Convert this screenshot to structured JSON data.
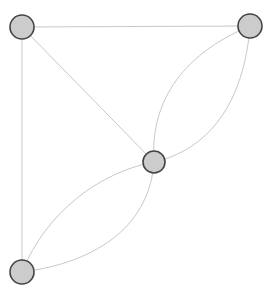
{
  "diagram": {
    "type": "graph",
    "width": 274,
    "height": 295,
    "background_color": "#ffffff"
  },
  "style": {
    "node_fill": "#cccccc",
    "node_stroke": "#444444",
    "node_stroke_width": 1.6,
    "node_radius": 12,
    "edge_color": "#c8c8c8",
    "edge_width": 1
  },
  "chart_data": {
    "type": "diagram",
    "nodes": [
      {
        "id": "top-left",
        "label": "1",
        "x": 22,
        "y": 27,
        "r": 12
      },
      {
        "id": "top-right",
        "label": "2",
        "x": 250,
        "y": 26,
        "r": 12
      },
      {
        "id": "center",
        "label": "3",
        "x": 154,
        "y": 162,
        "r": 11
      },
      {
        "id": "bottom-left",
        "label": "4",
        "x": 22,
        "y": 272,
        "r": 12
      }
    ],
    "edges": [
      {
        "id": "e1",
        "source": "top-left",
        "target": "top-right",
        "shape": "straight",
        "path": "M 22 27 L 250 26"
      },
      {
        "id": "e2",
        "source": "top-left",
        "target": "bottom-left",
        "shape": "straight",
        "path": "M 22 27 L 22 272"
      },
      {
        "id": "e3",
        "source": "top-left",
        "target": "center",
        "shape": "straight",
        "path": "M 22 27 L 154 162"
      },
      {
        "id": "e4",
        "source": "center",
        "target": "top-right",
        "shape": "curve-left",
        "path": "M 154 162 C 150 106 178 56 250 26"
      },
      {
        "id": "e5",
        "source": "center",
        "target": "top-right",
        "shape": "curve-right",
        "path": "M 154 162 C 208 150 244 104 250 26"
      },
      {
        "id": "e6",
        "source": "center",
        "target": "bottom-left",
        "shape": "curve-left",
        "path": "M 154 162 C 100 172 46 212 22 272"
      },
      {
        "id": "e7",
        "source": "center",
        "target": "bottom-left",
        "shape": "curve-right",
        "path": "M 154 162 C 150 222 102 262 22 272"
      }
    ],
    "node_count": 4,
    "edge_count": 7,
    "legend": [],
    "annotations": []
  }
}
